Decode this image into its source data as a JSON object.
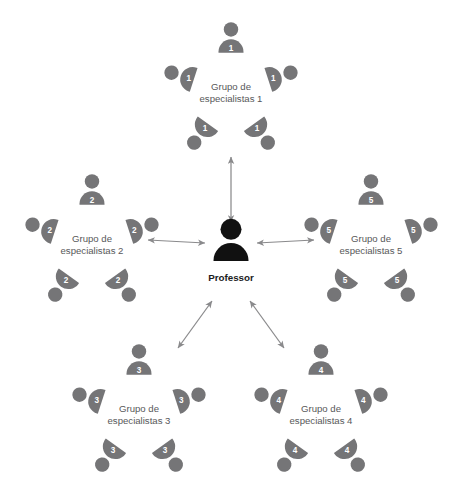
{
  "diagram": {
    "title_visible": false,
    "center": {
      "label": "Professor",
      "icon": "person-icon",
      "color": "#111111",
      "x": 231,
      "y": 252
    },
    "colors": {
      "member": "#757577",
      "center": "#111111",
      "label_text": "#58585a",
      "center_text": "#1c1c1c",
      "arrow": "#8a8a8c",
      "number_text": "#ffffff",
      "background": "#ffffff"
    },
    "groups": [
      {
        "id": "group-1",
        "label_line1": "Grupo de",
        "label_line2": "especialistas 1",
        "number": "1",
        "cx": 231,
        "cy": 92,
        "member_count": 5
      },
      {
        "id": "group-2",
        "label_line1": "Grupo de",
        "label_line2": "especialistas 2",
        "number": "2",
        "cx": 92,
        "cy": 244,
        "member_count": 5
      },
      {
        "id": "group-3",
        "label_line1": "Grupo de",
        "label_line2": "especialistas 3",
        "number": "3",
        "cx": 139,
        "cy": 414,
        "member_count": 5
      },
      {
        "id": "group-4",
        "label_line1": "Grupo de",
        "label_line2": "especialistas 4",
        "number": "4",
        "cx": 321,
        "cy": 414,
        "member_count": 5
      },
      {
        "id": "group-5",
        "label_line1": "Grupo de",
        "label_line2": "especialistas 5",
        "number": "5",
        "cx": 371,
        "cy": 244,
        "member_count": 5
      }
    ],
    "connectors": [
      {
        "id": "arrow-center-group-1",
        "from": "center",
        "to": "group-1",
        "style": "double-headed",
        "x1": 231,
        "y1": 222,
        "x2": 231,
        "y2": 157
      },
      {
        "id": "arrow-center-group-2",
        "from": "center",
        "to": "group-2",
        "style": "double-headed",
        "x1": 205,
        "y1": 243,
        "x2": 148,
        "y2": 240
      },
      {
        "id": "arrow-center-group-3",
        "from": "center",
        "to": "group-3",
        "style": "double-headed",
        "x1": 212,
        "y1": 301,
        "x2": 178,
        "y2": 348
      },
      {
        "id": "arrow-center-group-4",
        "from": "center",
        "to": "group-4",
        "style": "double-headed",
        "x1": 250,
        "y1": 301,
        "x2": 284,
        "y2": 348
      },
      {
        "id": "arrow-center-group-5",
        "from": "center",
        "to": "group-5",
        "style": "double-headed",
        "x1": 257,
        "y1": 243,
        "x2": 314,
        "y2": 240
      }
    ]
  }
}
